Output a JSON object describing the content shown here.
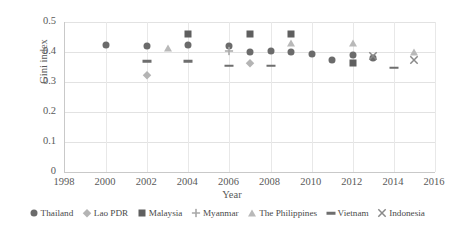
{
  "chart_data": {
    "type": "scatter",
    "title": "",
    "xlabel": "Year",
    "ylabel": "Gini index",
    "xlim": [
      1998,
      2016
    ],
    "ylim": [
      0,
      0.5
    ],
    "xticks": [
      "1998",
      "2000",
      "2002",
      "2004",
      "2006",
      "2008",
      "2010",
      "2012",
      "2014",
      "2016"
    ],
    "yticks": [
      "0",
      "0.1",
      "0.2",
      "0.3",
      "0.4",
      "0.5"
    ],
    "grid": true,
    "legend_position": "bottom",
    "series": [
      {
        "name": "Thailand",
        "marker": "circle",
        "color": "#6b6b6b",
        "points": [
          {
            "x": 2000,
            "y": 0.425
          },
          {
            "x": 2002,
            "y": 0.42
          },
          {
            "x": 2004,
            "y": 0.425
          },
          {
            "x": 2006,
            "y": 0.42
          },
          {
            "x": 2007,
            "y": 0.4
          },
          {
            "x": 2008,
            "y": 0.405
          },
          {
            "x": 2009,
            "y": 0.4
          },
          {
            "x": 2010,
            "y": 0.395
          },
          {
            "x": 2011,
            "y": 0.375
          },
          {
            "x": 2012,
            "y": 0.39
          },
          {
            "x": 2013,
            "y": 0.38
          }
        ]
      },
      {
        "name": "Lao PDR",
        "marker": "diamond",
        "color": "#b4b4b4",
        "points": [
          {
            "x": 2002,
            "y": 0.325
          },
          {
            "x": 2007,
            "y": 0.365
          }
        ]
      },
      {
        "name": "Malaysia",
        "marker": "square",
        "color": "#5f5f5f",
        "points": [
          {
            "x": 2004,
            "y": 0.46
          },
          {
            "x": 2007,
            "y": 0.46
          },
          {
            "x": 2009,
            "y": 0.46
          },
          {
            "x": 2012,
            "y": 0.365
          }
        ]
      },
      {
        "name": "Myanmar",
        "marker": "plus",
        "color": "#a8a8a8",
        "points": [
          {
            "x": 2006,
            "y": 0.42
          }
        ]
      },
      {
        "name": "The Philippines",
        "marker": "triangle",
        "color": "#b9b9b9",
        "points": [
          {
            "x": 2003,
            "y": 0.415
          },
          {
            "x": 2009,
            "y": 0.43
          },
          {
            "x": 2012,
            "y": 0.43
          },
          {
            "x": 2015,
            "y": 0.4
          }
        ]
      },
      {
        "name": "Vietnam",
        "marker": "dash",
        "color": "#6e6e6e",
        "points": [
          {
            "x": 2002,
            "y": 0.37
          },
          {
            "x": 2004,
            "y": 0.37
          },
          {
            "x": 2006,
            "y": 0.355
          },
          {
            "x": 2008,
            "y": 0.355
          },
          {
            "x": 2014,
            "y": 0.348
          }
        ]
      },
      {
        "name": "Indonesia",
        "marker": "cross",
        "color": "#8a8a8a",
        "points": [
          {
            "x": 2013,
            "y": 0.405
          },
          {
            "x": 2015,
            "y": 0.39
          }
        ]
      }
    ]
  }
}
